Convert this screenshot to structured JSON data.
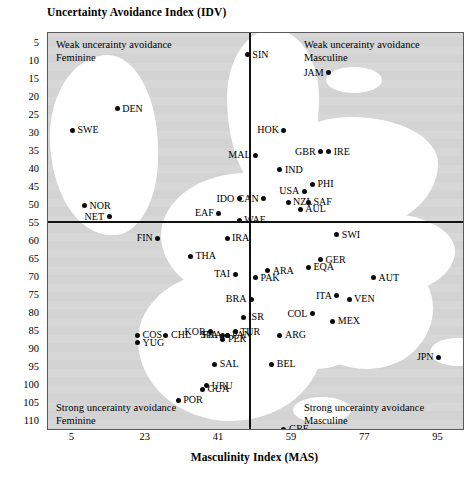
{
  "chart_data": {
    "type": "scatter",
    "title": "Uncertainty Avoidance Index (IDV)",
    "xlabel": "Masculinity Index (MAS)",
    "ylabel": "Uncertainty Avoidance Index (IDV)",
    "xlim": [
      -1,
      101
    ],
    "ylim": [
      2,
      112
    ],
    "y_inverted": true,
    "grid": false,
    "legend": "none",
    "x_ticks": [
      5,
      23,
      41,
      59,
      77,
      95
    ],
    "y_ticks": [
      5,
      10,
      15,
      20,
      25,
      30,
      35,
      40,
      45,
      50,
      55,
      60,
      65,
      70,
      75,
      80,
      85,
      90,
      95,
      100,
      105,
      110
    ],
    "quadrant_divider_x": 50,
    "quadrant_divider_y": 54,
    "quadrant_labels": [
      {
        "id": "top-left",
        "line1": "Weak uncerainty avoidance",
        "line2": "Feminine"
      },
      {
        "id": "top-right",
        "line1": "Weak uncerainty avoidance",
        "line2": "Masculine"
      },
      {
        "id": "bottom-left",
        "line1": "Strong uncerainty avoidance",
        "line2": "Feminine"
      },
      {
        "id": "bottom-right",
        "line1": "Strong uncerainty avoidance",
        "line2": "Masculine"
      }
    ],
    "points": [
      {
        "label": "SIN",
        "x": 48,
        "y": 8,
        "label_side": "right"
      },
      {
        "label": "JAM",
        "x": 68,
        "y": 13,
        "label_side": "left"
      },
      {
        "label": "DEN",
        "x": 16,
        "y": 23,
        "label_side": "right"
      },
      {
        "label": "SWE",
        "x": 5,
        "y": 29,
        "label_side": "right"
      },
      {
        "label": "HOK",
        "x": 57,
        "y": 29,
        "label_side": "left"
      },
      {
        "label": "GBR",
        "x": 66,
        "y": 35,
        "label_side": "left"
      },
      {
        "label": "IRE",
        "x": 68,
        "y": 35,
        "label_side": "right"
      },
      {
        "label": "MAL",
        "x": 50,
        "y": 36,
        "label_side": "left"
      },
      {
        "label": "IND",
        "x": 56,
        "y": 40,
        "label_side": "right"
      },
      {
        "label": "CAN",
        "x": 52,
        "y": 48,
        "label_side": "left"
      },
      {
        "label": "USA",
        "x": 62,
        "y": 46,
        "label_side": "left"
      },
      {
        "label": "PHI",
        "x": 64,
        "y": 44,
        "label_side": "right"
      },
      {
        "label": "NZL",
        "x": 58,
        "y": 49,
        "label_side": "right"
      },
      {
        "label": "SAF",
        "x": 63,
        "y": 49,
        "label_side": "right"
      },
      {
        "label": "AUL",
        "x": 61,
        "y": 51,
        "label_side": "right"
      },
      {
        "label": "IDO",
        "x": 46,
        "y": 48,
        "label_side": "left"
      },
      {
        "label": "NOR",
        "x": 8,
        "y": 50,
        "label_side": "right"
      },
      {
        "label": "NET",
        "x": 14,
        "y": 53,
        "label_side": "left"
      },
      {
        "label": "EAF",
        "x": 41,
        "y": 52,
        "label_side": "left"
      },
      {
        "label": "WAF",
        "x": 46,
        "y": 54,
        "label_side": "right"
      },
      {
        "label": "SWI",
        "x": 70,
        "y": 58,
        "label_side": "right"
      },
      {
        "label": "FIN",
        "x": 26,
        "y": 59,
        "label_side": "left"
      },
      {
        "label": "IRA",
        "x": 43,
        "y": 59,
        "label_side": "right"
      },
      {
        "label": "THA",
        "x": 34,
        "y": 64,
        "label_side": "right"
      },
      {
        "label": "GER",
        "x": 66,
        "y": 65,
        "label_side": "right"
      },
      {
        "label": "ARA",
        "x": 53,
        "y": 68,
        "label_side": "right"
      },
      {
        "label": "TAI",
        "x": 45,
        "y": 69,
        "label_side": "left"
      },
      {
        "label": "PAK",
        "x": 50,
        "y": 70,
        "label_side": "right"
      },
      {
        "label": "EQA",
        "x": 63,
        "y": 67,
        "label_side": "right"
      },
      {
        "label": "AUT",
        "x": 79,
        "y": 70,
        "label_side": "right"
      },
      {
        "label": "ITA",
        "x": 70,
        "y": 75,
        "label_side": "left"
      },
      {
        "label": "VEN",
        "x": 73,
        "y": 76,
        "label_side": "right"
      },
      {
        "label": "BRA",
        "x": 49,
        "y": 76,
        "label_side": "left"
      },
      {
        "label": "COL",
        "x": 64,
        "y": 80,
        "label_side": "left"
      },
      {
        "label": "FRA",
        "x": 43,
        "y": 86,
        "label_side": "left"
      },
      {
        "label": "ISR",
        "x": 47,
        "y": 81,
        "label_side": "right"
      },
      {
        "label": "SPA",
        "x": 42,
        "y": 86,
        "label_side": "left"
      },
      {
        "label": "TUR",
        "x": 45,
        "y": 85,
        "label_side": "right"
      },
      {
        "label": "COS",
        "x": 21,
        "y": 86,
        "label_side": "right"
      },
      {
        "label": "CHL",
        "x": 28,
        "y": 86,
        "label_side": "right"
      },
      {
        "label": "MEX",
        "x": 69,
        "y": 82,
        "label_side": "right"
      },
      {
        "label": "YUG",
        "x": 21,
        "y": 88,
        "label_side": "right"
      },
      {
        "label": "KOR",
        "x": 39,
        "y": 85,
        "label_side": "left"
      },
      {
        "label": "PAN",
        "x": 43,
        "y": 86,
        "label_side": "right"
      },
      {
        "label": "ARG",
        "x": 56,
        "y": 86,
        "label_side": "right"
      },
      {
        "label": "PER",
        "x": 42,
        "y": 87,
        "label_side": "right"
      },
      {
        "label": "BEL",
        "x": 54,
        "y": 94,
        "label_side": "right"
      },
      {
        "label": "JPN",
        "x": 95,
        "y": 92,
        "label_side": "left"
      },
      {
        "label": "SAL",
        "x": 40,
        "y": 94,
        "label_side": "right"
      },
      {
        "label": "URU",
        "x": 38,
        "y": 100,
        "label_side": "right"
      },
      {
        "label": "GUA",
        "x": 37,
        "y": 101,
        "label_side": "right"
      },
      {
        "label": "POR",
        "x": 31,
        "y": 104,
        "label_side": "right"
      },
      {
        "label": "GRE",
        "x": 57,
        "y": 112,
        "label_side": "right"
      }
    ]
  },
  "axes": {
    "y_title": "Uncertainty Avoidance Index (IDV)",
    "x_title": "Masculinity Index (MAS)"
  },
  "colors": {
    "plot_background": "#d7d7d7",
    "blob_fill": "#ffffff",
    "point": "#0b0b0b",
    "frame": "#5a5a5a",
    "divider": "#111111"
  }
}
